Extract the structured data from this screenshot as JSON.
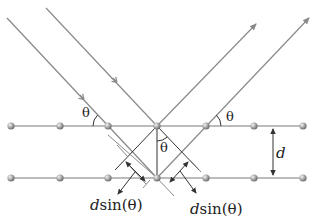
{
  "diagram": {
    "colors": {
      "ray": "#8a8a8a",
      "plane": "#7a7a7a",
      "construction": "#333333",
      "atom": "#9a9a9a",
      "text": "#222222"
    },
    "labels": {
      "theta_incident": "θ",
      "theta_reflected": "θ",
      "theta_center": "θ",
      "spacing": "d",
      "path_left_var": "d",
      "path_left_fn": "sin(θ)",
      "path_right_var": "d",
      "path_right_fn": "sin(θ)"
    },
    "planes": [
      {
        "name": "upper-plane",
        "y": 126,
        "atoms_x": [
          11,
          60,
          108,
          157,
          206,
          254,
          303
        ]
      },
      {
        "name": "lower-plane",
        "y": 178,
        "atoms_x": [
          11,
          60,
          108,
          157,
          206,
          254,
          303
        ]
      }
    ]
  }
}
